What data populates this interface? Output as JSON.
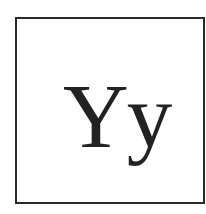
{
  "specimen": {
    "text": "Yy",
    "color": "#222222",
    "border_color": "#2a2a2a",
    "background": "#ffffff"
  }
}
